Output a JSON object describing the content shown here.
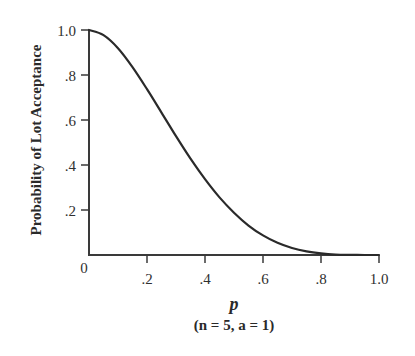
{
  "chart_data": {
    "type": "line",
    "title": "",
    "xlabel": "p",
    "xlabel_sub": "(n = 5, a = 1)",
    "ylabel": "Probability of Lot Acceptance",
    "xlim": [
      0,
      1.0
    ],
    "ylim": [
      0,
      1.0
    ],
    "grid": false,
    "legend": null,
    "x_ticks": [
      0,
      0.2,
      0.4,
      0.6,
      0.8,
      1.0
    ],
    "x_tick_labels": [
      "0",
      ".2",
      ".4",
      ".6",
      ".8",
      "1.0"
    ],
    "y_ticks": [
      0.2,
      0.4,
      0.6,
      0.8,
      1.0
    ],
    "y_tick_labels": [
      ".2",
      ".4",
      ".6",
      ".8",
      "1.0"
    ],
    "series": [
      {
        "name": "OC curve (n = 5, a = 1)",
        "color": "#2a2a2a",
        "x": [
          0,
          0.05,
          0.1,
          0.15,
          0.2,
          0.25,
          0.3,
          0.35,
          0.4,
          0.45,
          0.5,
          0.55,
          0.6,
          0.65,
          0.7,
          0.75,
          0.8,
          0.85,
          0.9,
          0.95,
          1.0
        ],
        "values": [
          1.0,
          0.977,
          0.919,
          0.835,
          0.737,
          0.633,
          0.528,
          0.428,
          0.337,
          0.256,
          0.188,
          0.131,
          0.087,
          0.054,
          0.031,
          0.016,
          0.007,
          0.002,
          0.0005,
          0.0,
          0.0
        ]
      }
    ]
  },
  "axes": {
    "y_label": "Probability of Lot Acceptance",
    "x_label": "p",
    "x_sublabel": "(n = 5, a = 1)",
    "x_ticks": [
      ".2",
      ".4",
      ".6",
      ".8",
      "1.0"
    ],
    "y_ticks": [
      ".2",
      ".4",
      ".6",
      ".8",
      "1.0"
    ],
    "origin": "0"
  }
}
